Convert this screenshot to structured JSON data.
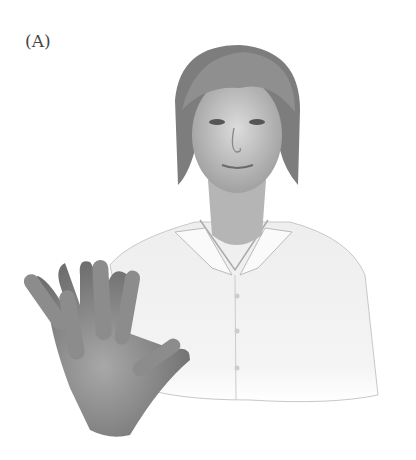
{
  "figure": {
    "panel_label": "(A)",
    "colors": {
      "background": "#ffffff",
      "hair": "#8a8a8a",
      "skin": "#bdbdbd",
      "shirt": "#f2f2f2",
      "hand": "#9a9a9a"
    }
  }
}
